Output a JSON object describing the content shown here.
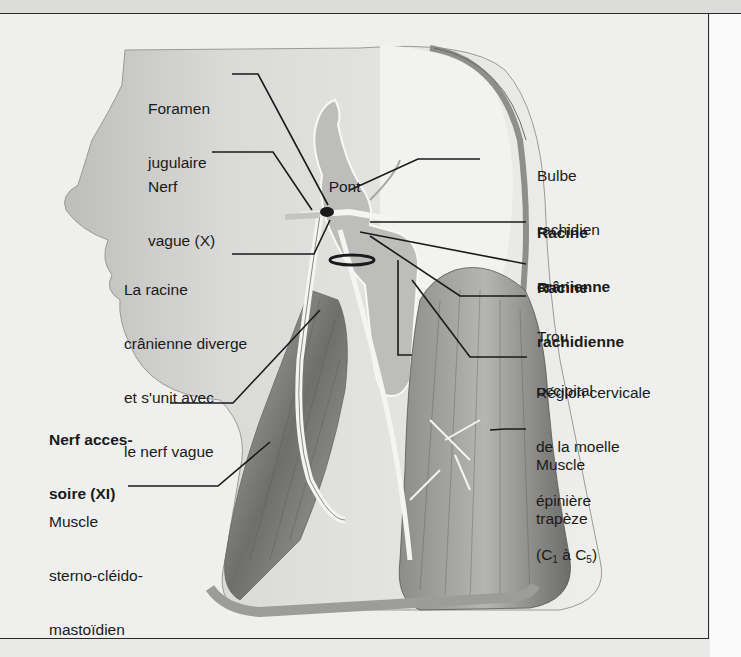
{
  "figure": {
    "colors": {
      "background": "#efefed",
      "skin": "#d4d4d2",
      "muscle": "#8a8a88",
      "nerve": "#f4f4f2",
      "leader_lines": "#1a1a1a"
    }
  },
  "labels": {
    "foramen_jugulaire": {
      "line1": "Foramen",
      "line2": "jugulaire"
    },
    "nerf_vague": {
      "line1": "Nerf",
      "line2": "vague (X)"
    },
    "pont": {
      "text": "Pont"
    },
    "bulbe_rachidien": {
      "line1": "Bulbe",
      "line2": "rachidien"
    },
    "racine_cranienne": {
      "line1": "Racine",
      "line2": "crânienne"
    },
    "racine_rachidienne": {
      "line1": "Racine",
      "line2": "rachidienne"
    },
    "trou_occipital": {
      "line1": "Trou",
      "line2": "occipital"
    },
    "racine_diverge": {
      "line1": "La racine",
      "line2": "crânienne diverge",
      "line3": "et s'unit avec",
      "line4": "le nerf vague"
    },
    "region_cervicale": {
      "line1": "Région cervicale",
      "line2": "de la moelle",
      "line3": "épinière",
      "line4_a": "(C",
      "sub1": "1",
      "line4_b": " à C",
      "sub5": "5",
      "line4_c": ")"
    },
    "nerf_accessoire": {
      "line1": "Nerf acces-",
      "line2": "soire (XI)"
    },
    "muscle_trapeze": {
      "line1": "Muscle",
      "line2": "trapèze"
    },
    "muscle_scm": {
      "line1": "Muscle",
      "line2": "sterno-cléido-",
      "line3": "mastoïdien"
    }
  }
}
